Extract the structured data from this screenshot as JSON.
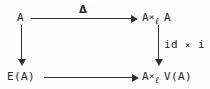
{
  "figure": {
    "kind": "commutative-diagram",
    "shape": "square",
    "background_color": "#fdfdfd",
    "ink_color": "#2b2b2b"
  },
  "nodes": {
    "top_left": {
      "text": "A",
      "position": "top-left"
    },
    "top_right": {
      "left": "A",
      "operator": "×",
      "subscript": "ℓ",
      "right": "A",
      "position": "top-right"
    },
    "bottom_left": {
      "text": "E(A)",
      "position": "bottom-left"
    },
    "bottom_right": {
      "left": "A",
      "operator": "×",
      "subscript": "ℓ",
      "right": "V(A)",
      "position": "bottom-right"
    }
  },
  "arrows": {
    "top": {
      "from": "A",
      "to": "A ×ℓ A",
      "direction": "right",
      "label": "Δ"
    },
    "bottom": {
      "from": "E(A)",
      "to": "A ×ℓ V(A)",
      "direction": "right",
      "label": ""
    },
    "left": {
      "from": "A",
      "to": "E(A)",
      "direction": "down",
      "label": ""
    },
    "right": {
      "from": "A ×ℓ A",
      "to": "A ×ℓ V(A)",
      "direction": "down",
      "label": "id × i"
    }
  },
  "labels": {
    "delta": "Δ",
    "id_times_i_prefix": "id",
    "id_times_i_operator": "×",
    "id_times_i_suffix": "i"
  }
}
